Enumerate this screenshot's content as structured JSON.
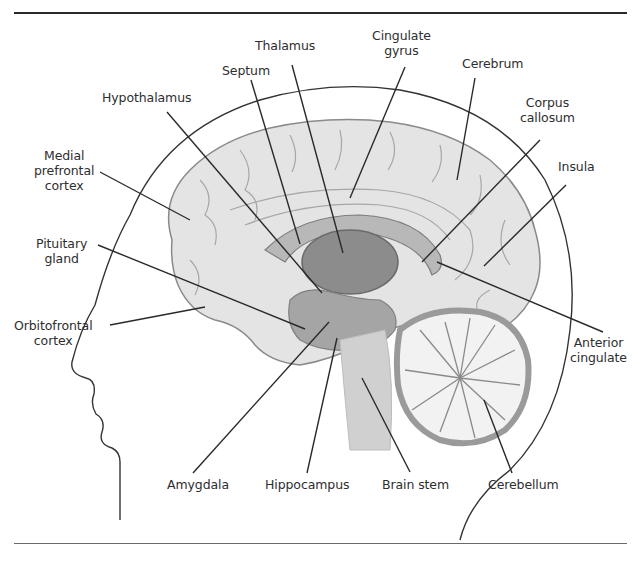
{
  "figure": {
    "labels": {
      "thalamus": "Thalamus",
      "septum": "Septum",
      "cingulate_gyrus": "Cingulate\ngyrus",
      "cerebrum": "Cerebrum",
      "hypothalamus": "Hypothalamus",
      "corpus_callosum": "Corpus\ncallosum",
      "medial_prefrontal_cortex": "Medial\nprefrontal\ncortex",
      "insula": "Insula",
      "pituitary_gland": "Pituitary\ngland",
      "orbitofrontal_cortex": "Orbitofrontal\ncortex",
      "anterior_cingulate": "Anterior\ncingulate",
      "amygdala": "Amygdala",
      "hippocampus": "Hippocampus",
      "brain_stem": "Brain stem",
      "cerebellum": "Cerebellum"
    },
    "colors": {
      "line": "#2a2a2a",
      "brain_fill": "#e4e4e4",
      "brain_stroke": "#8a8a8a",
      "thalamus_fill": "#8c8c8c",
      "cerebellum_fill": "#f2f2f2",
      "cerebellum_rim": "#9a9a9a"
    }
  }
}
